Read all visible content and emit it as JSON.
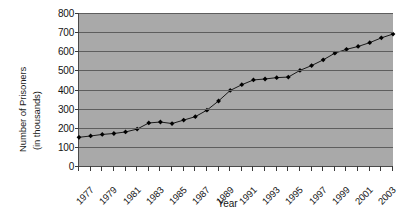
{
  "chart_data": {
    "type": "line",
    "title": "",
    "xlabel": "Year",
    "ylabel": "Number of Prisoners (in thousands)",
    "ylabel_line1": "Number of Prisoners",
    "ylabel_line2": "(in thousands)",
    "ylim": [
      0,
      800
    ],
    "ytick_step": 100,
    "yticks": [
      "800",
      "700",
      "600",
      "500",
      "400",
      "300",
      "200",
      "100",
      "0"
    ],
    "ytick_values": [
      800,
      700,
      600,
      500,
      400,
      300,
      200,
      100,
      0
    ],
    "grid": true,
    "grid_axis": "y",
    "legend": "none",
    "xlim": [
      1977,
      2004
    ],
    "xtick_labels": [
      "1977",
      "1979",
      "1981",
      "1983",
      "1985",
      "1987",
      "1989",
      "1991",
      "1993",
      "1995",
      "1997",
      "1999",
      "2001",
      "2003"
    ],
    "xtick_values": [
      1977,
      1979,
      1981,
      1983,
      1985,
      1987,
      1989,
      1991,
      1993,
      1995,
      1997,
      1999,
      2001,
      2003
    ],
    "xtick_label_rotation": -45,
    "marker": "diamond",
    "x": [
      1977,
      1978,
      1979,
      1980,
      1981,
      1982,
      1983,
      1984,
      1985,
      1986,
      1987,
      1988,
      1989,
      1990,
      1991,
      1992,
      1993,
      1994,
      1995,
      1996,
      1997,
      1998,
      1999,
      2000,
      2001,
      2002,
      2003,
      2004
    ],
    "values": [
      150,
      157,
      165,
      170,
      178,
      193,
      225,
      230,
      222,
      240,
      258,
      292,
      340,
      395,
      425,
      450,
      455,
      462,
      465,
      500,
      525,
      555,
      590,
      610,
      625,
      645,
      670,
      690
    ],
    "colors": {
      "plot_background": "#a9a9a9",
      "grid": "#5e5e5e",
      "axis": "#4a4a4a",
      "series_line": "#1a1a1a",
      "series_marker": "#000000",
      "page_background": "#ffffff",
      "text": "#141414"
    }
  }
}
